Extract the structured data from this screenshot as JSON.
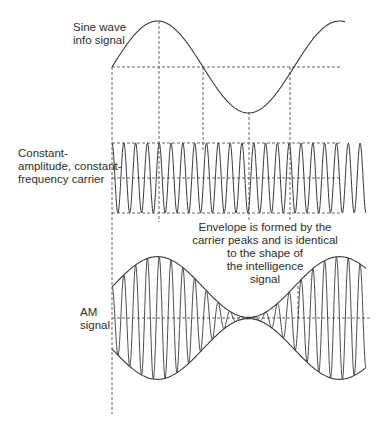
{
  "labels": {
    "sine": [
      "Sine wave",
      "info signal"
    ],
    "carrier": [
      "Constant-",
      "amplitude, constant-",
      "frequency carrier"
    ],
    "envelope": [
      "Envelope is formed by the",
      "carrier peaks and is identical",
      "to the shape of",
      "the intelligence",
      "signal"
    ],
    "am": [
      "AM",
      "signal"
    ]
  },
  "colors": {
    "stroke": "#3a3a3a",
    "dash": "#555555",
    "text": "#2e2e2e"
  },
  "geometry": {
    "left_x": 112,
    "sine": {
      "mid_y": 67,
      "amp": 46,
      "x_start": 112,
      "x_end": 345,
      "period": 182
    },
    "carrier": {
      "mid_y": 178,
      "amp": 35,
      "x_start": 112,
      "x_end": 366,
      "cycles": 21.5
    },
    "am": {
      "mid_y": 318,
      "amp": 62,
      "x_start": 112,
      "x_end": 366,
      "cycles": 21.5
    },
    "verticals": [
      {
        "x": 112,
        "y1": 67,
        "y2": 414
      },
      {
        "x": 159,
        "y1": 21,
        "y2": 222
      },
      {
        "x": 203,
        "y1": 67,
        "y2": 150
      },
      {
        "x": 249,
        "y1": 112,
        "y2": 222
      },
      {
        "x": 290,
        "y1": 67,
        "y2": 222
      }
    ]
  }
}
